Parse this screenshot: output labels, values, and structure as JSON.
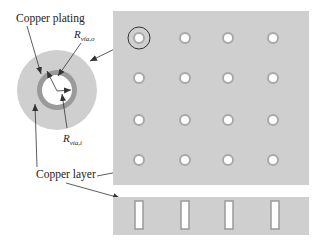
{
  "figure": {
    "labels": {
      "copper_plating": "Copper plating",
      "copper_layer": "Copper layer",
      "r_via_o": {
        "main": "R",
        "sub": "via,o"
      },
      "r_via_i": {
        "main": "R",
        "sub": "via,i"
      }
    },
    "colors": {
      "background": "#ffffff",
      "copper_layer": "#cfcfcf",
      "copper_plating": "#9a9a9a",
      "via_hole": "#ffffff",
      "arrow": "#333333",
      "text": "#222222"
    },
    "via_array": {
      "rows": 4,
      "columns": 4,
      "highlighted_via": {
        "row": 0,
        "column": 0
      }
    },
    "cross_section": {
      "via_slots": 4
    }
  }
}
